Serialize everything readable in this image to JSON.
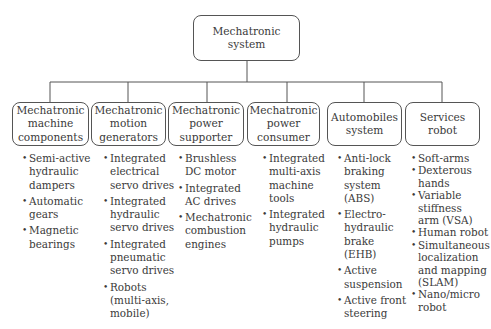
{
  "root": {
    "label_line1": "Mechatronic",
    "label_line2": "system"
  },
  "categories": [
    {
      "title": [
        "Mechatronic",
        "machine",
        "components"
      ],
      "items": [
        "Semi-active\nhydraulic\ndampers",
        "Automatic\ngears",
        "Magnetic\nbearings"
      ]
    },
    {
      "title": [
        "Mechatronic",
        "motion",
        "generators"
      ],
      "items": [
        "Integrated\nelectrical\nservo drives",
        "Integrated\nhydraulic\nservo drives",
        "Integrated\npneumatic\nservo drives",
        "Robots\n(multi-axis,\nmobile)"
      ]
    },
    {
      "title": [
        "Mechatronic",
        "power",
        "supporter"
      ],
      "items": [
        "Brushless\nDC motor",
        "Integrated\nAC drives",
        "Mechatronic\ncombustion\nengines"
      ]
    },
    {
      "title": [
        "Mechatronic",
        "power",
        "consumer"
      ],
      "items": [
        "Integrated\nmulti-axis\nmachine\ntools",
        "Integrated\nhydraulic\npumps"
      ]
    },
    {
      "title": [
        "Automobiles",
        "system"
      ],
      "items": [
        "Anti-lock\nbraking\nsystem (ABS)",
        "Electro-\nhydraulic\nbrake (EHB)",
        "Active\nsuspension",
        "Active front\nsteering"
      ]
    },
    {
      "title": [
        "Services",
        "robot"
      ],
      "items": [
        "Soft-arms",
        "Dexterous\nhands",
        "Variable\nstiffness\narm (VSA)",
        "Human robot",
        "Simultaneous\nlocalization\nand mapping\n(SLAM)",
        "Nano/micro\nrobot"
      ]
    }
  ],
  "colors": {
    "line": "#555555",
    "text": "#3a3a3a",
    "background": "#ffffff"
  }
}
